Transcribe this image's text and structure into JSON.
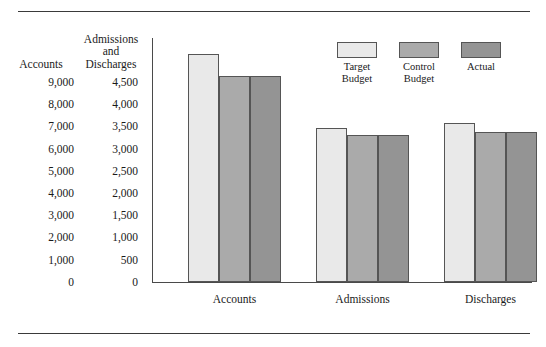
{
  "axis_columns": {
    "accounts_header": "Accounts",
    "admissions_header": "Admissions\nand\nDischarges"
  },
  "legend": {
    "items": [
      {
        "label": "Target\nBudget",
        "color": "#e9e9e9"
      },
      {
        "label": "Control\nBudget",
        "color": "#aaaaaa"
      },
      {
        "label": "Actual",
        "color": "#949494"
      }
    ]
  },
  "chart_data": {
    "type": "bar",
    "title": "",
    "subtitle": "",
    "xlabel": "",
    "ylabel": "Accounts",
    "ylabel_secondary": "Admissions and Discharges",
    "grid": false,
    "legend_position": "top-right",
    "categories": [
      "Accounts",
      "Admissions",
      "Discharges"
    ],
    "series": [
      {
        "name": "Target Budget",
        "color": "#e9e9e9",
        "values": [
          9200,
          3100,
          3200
        ]
      },
      {
        "name": "Control Budget",
        "color": "#aaaaaa",
        "values": [
          8300,
          2960,
          3030
        ]
      },
      {
        "name": "Actual",
        "color": "#949494",
        "values": [
          8300,
          2960,
          3030
        ]
      }
    ],
    "ylim": [
      0,
      9000
    ],
    "ylim_secondary": [
      0,
      4500
    ],
    "yticks": [
      9000,
      8000,
      7000,
      6000,
      5000,
      4000,
      3000,
      2000,
      1000,
      0
    ],
    "ytick_labels_accounts": [
      "9,000",
      "8,000",
      "7,000",
      "6,000",
      "5,000",
      "4,000",
      "3,000",
      "2,000",
      "1,000",
      "0"
    ],
    "ytick_labels_admissions": [
      "4,500",
      "4,000",
      "3,500",
      "3,000",
      "2,500",
      "2,000",
      "1,500",
      "1,000",
      "500",
      "0"
    ],
    "note": "Accounts group read on the Accounts scale; Admissions and Discharges groups read on the Admissions and Discharges scale."
  }
}
